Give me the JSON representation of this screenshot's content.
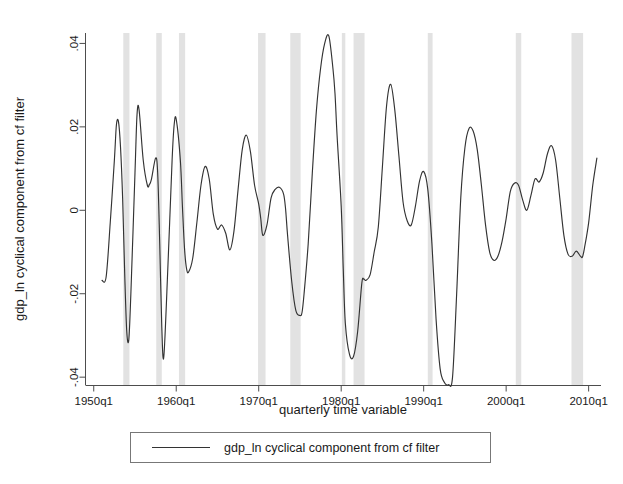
{
  "chart_data": {
    "type": "line",
    "title": "",
    "xlabel": "quarterly time variable",
    "ylabel": "gdp_ln cyclical component from cf filter",
    "xlim": [
      1949.0,
      2011.5
    ],
    "ylim": [
      -0.042,
      0.0425
    ],
    "grid": false,
    "legend_position": "below-plot",
    "x_tick_labels": [
      "1950q1",
      "1960q1",
      "1970q1",
      "1980q1",
      "1990q1",
      "2000q1",
      "2010q1"
    ],
    "x_tick_values": [
      1950,
      1960,
      1970,
      1980,
      1990,
      2000,
      2010
    ],
    "y_tick_labels": [
      ".04",
      ".02",
      "0",
      "-.02",
      "-.04"
    ],
    "y_tick_values": [
      0.04,
      0.02,
      0,
      -0.02,
      -0.04
    ],
    "series": [
      {
        "name": "gdp_ln cyclical component from cf filter",
        "color": "#333333",
        "x": [
          1951.0,
          1951.5,
          1952.0,
          1952.5,
          1952.75,
          1953.0,
          1953.25,
          1953.5,
          1953.75,
          1954.0,
          1954.25,
          1954.5,
          1955.0,
          1955.25,
          1955.5,
          1956.0,
          1956.5,
          1956.75,
          1957.0,
          1957.5,
          1957.75,
          1958.0,
          1958.25,
          1958.5,
          1959.0,
          1959.5,
          1959.75,
          1960.0,
          1960.5,
          1960.75,
          1961.0,
          1961.25,
          1961.5,
          1962.0,
          1962.5,
          1963.0,
          1963.5,
          1964.0,
          1964.5,
          1965.0,
          1965.5,
          1966.0,
          1966.5,
          1967.0,
          1967.5,
          1968.0,
          1968.5,
          1969.0,
          1969.5,
          1970.0,
          1970.25,
          1970.5,
          1971.0,
          1971.5,
          1972.0,
          1972.5,
          1973.0,
          1973.25,
          1973.5,
          1974.0,
          1974.5,
          1975.0,
          1975.25,
          1975.5,
          1976.0,
          1976.5,
          1977.0,
          1977.5,
          1978.0,
          1978.5,
          1979.0,
          1979.25,
          1979.5,
          1980.0,
          1980.25,
          1980.5,
          1981.0,
          1981.5,
          1982.0,
          1982.5,
          1982.75,
          1983.0,
          1983.5,
          1984.0,
          1984.5,
          1985.0,
          1985.5,
          1986.0,
          1986.5,
          1987.0,
          1987.5,
          1988.0,
          1988.5,
          1989.0,
          1989.5,
          1990.0,
          1990.5,
          1991.0,
          1991.5,
          1992.0,
          1992.5,
          1993.0,
          1993.5,
          1994.0,
          1994.5,
          1995.0,
          1995.5,
          1996.0,
          1996.5,
          1997.0,
          1997.5,
          1998.0,
          1998.5,
          1999.0,
          1999.5,
          2000.0,
          2000.5,
          2001.0,
          2001.5,
          2002.0,
          2002.5,
          2003.0,
          2003.5,
          2004.0,
          2004.5,
          2005.0,
          2005.5,
          2006.0,
          2006.5,
          2007.0,
          2007.5,
          2008.0,
          2008.5,
          2009.0,
          2009.25,
          2009.5,
          2010.0,
          2010.5,
          2011.0
        ],
        "y": [
          -0.0168,
          -0.016,
          -0.003,
          0.012,
          0.0205,
          0.0212,
          0.015,
          0.003,
          -0.015,
          -0.029,
          -0.031,
          -0.02,
          0.009,
          0.023,
          0.024,
          0.012,
          0.006,
          0.0062,
          0.0075,
          0.0125,
          0.009,
          -0.008,
          -0.028,
          -0.035,
          -0.013,
          0.012,
          0.0205,
          0.0218,
          0.012,
          0.001,
          -0.009,
          -0.014,
          -0.0148,
          -0.0115,
          -0.003,
          0.006,
          0.0105,
          0.0075,
          -0.001,
          -0.0045,
          -0.0035,
          -0.0055,
          -0.0095,
          -0.005,
          0.005,
          0.0145,
          0.018,
          0.014,
          0.006,
          0.0015,
          -0.002,
          -0.006,
          -0.0035,
          0.003,
          0.005,
          0.0055,
          0.004,
          0.0005,
          -0.006,
          -0.017,
          -0.024,
          -0.0252,
          -0.0245,
          -0.02,
          -0.008,
          0.009,
          0.024,
          0.034,
          0.04,
          0.0418,
          0.034,
          0.028,
          0.018,
          0.001,
          -0.014,
          -0.027,
          -0.0345,
          -0.035,
          -0.029,
          -0.0175,
          -0.0165,
          -0.0168,
          -0.0155,
          -0.01,
          -0.004,
          0.0105,
          0.025,
          0.0302,
          0.024,
          0.013,
          0.002,
          -0.0025,
          -0.0035,
          0.001,
          0.007,
          0.0093,
          0.005,
          -0.008,
          -0.026,
          -0.038,
          -0.0412,
          -0.0418,
          -0.04,
          -0.02,
          0.003,
          0.015,
          0.0196,
          0.019,
          0.0145,
          0.006,
          -0.0035,
          -0.01,
          -0.012,
          -0.011,
          -0.0075,
          -0.002,
          0.0045,
          0.0065,
          0.006,
          0.0025,
          0.0,
          0.0035,
          0.0075,
          0.0068,
          0.009,
          0.0135,
          0.0155,
          0.012,
          0.003,
          -0.006,
          -0.0105,
          -0.011,
          -0.0098,
          -0.011,
          -0.0112,
          -0.009,
          -0.003,
          0.006,
          0.0125
        ]
      }
    ],
    "legend": [
      {
        "label": "gdp_ln cyclical component from cf filter",
        "color": "#333333"
      }
    ],
    "recession_bands": {
      "color": "#e2e2e2",
      "label": "NBER recession shading",
      "spans": [
        [
          1953.58,
          1954.33
        ],
        [
          1957.58,
          1958.25
        ],
        [
          1960.33,
          1961.08
        ],
        [
          1969.92,
          1970.83
        ],
        [
          1973.83,
          1975.08
        ],
        [
          1980.08,
          1980.5
        ],
        [
          1981.5,
          1982.83
        ],
        [
          1990.5,
          1991.08
        ],
        [
          2001.17,
          2001.83
        ],
        [
          2007.92,
          2009.33
        ]
      ]
    }
  },
  "axis": {
    "y_title": "gdp_ln cyclical component from cf filter",
    "x_title": "quarterly time variable"
  },
  "legend": {
    "entry_label": "gdp_ln cyclical component from cf filter"
  }
}
